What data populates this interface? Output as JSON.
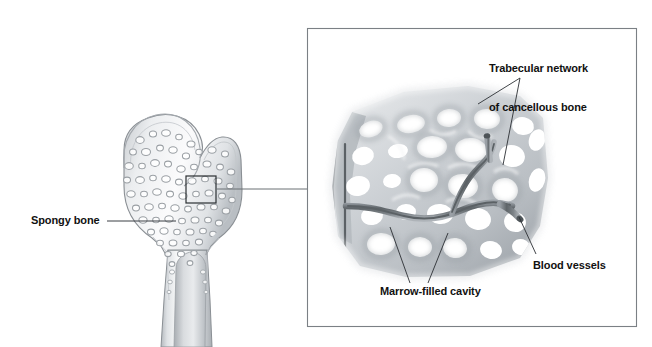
{
  "figure": {
    "type": "anatomical-illustration",
    "background_color": "#ffffff"
  },
  "labels": {
    "spongy_bone": "Spongy bone",
    "trabecular_line1": "Trabecular network",
    "trabecular_line2": "of cancellous bone",
    "marrow_cavity": "Marrow-filled cavity",
    "blood_vessels": "Blood vessels"
  },
  "icons": {
    "detail_box": "detail-box-icon",
    "leader_line": "leader-line-icon",
    "magnified_panel": "magnified-panel-icon"
  },
  "colors": {
    "bone_outline": "#8a8f94",
    "bone_fill_light": "#f2f3f4",
    "bone_fill_mid": "#d6d9dc",
    "bone_fill_dark": "#a9aeb3",
    "cavity_white": "#ffffff",
    "vessel_dark": "#6f7479",
    "leader_line": "#5a5f64",
    "panel_border": "#7b8085",
    "text": "#111111"
  },
  "geometry": {
    "panel": {
      "x": 307,
      "y": 28,
      "width": 330,
      "height": 299
    },
    "detail_box": {
      "x": 186,
      "y": 176,
      "width": 30,
      "height": 27
    },
    "connector_y": 189,
    "spongy_leader": {
      "x1": 107,
      "y1": 221,
      "x2": 176,
      "y2": 221
    }
  }
}
